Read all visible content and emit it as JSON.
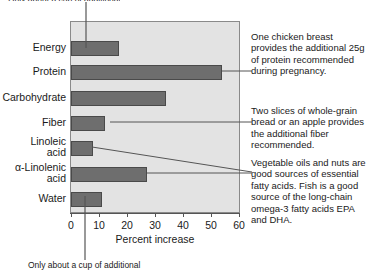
{
  "figure": {
    "top_caption": "Only about a cup of additional",
    "bottom_caption": "Only about a cup of additional"
  },
  "chart_data": {
    "type": "bar",
    "orientation": "horizontal",
    "title": "",
    "xlabel": "Percent increase",
    "ylabel": "",
    "xlim": [
      0,
      60
    ],
    "ticks": [
      "0",
      "10",
      "20",
      "30",
      "40",
      "50",
      "60"
    ],
    "tick_values": [
      0,
      10,
      20,
      30,
      40,
      50,
      60
    ],
    "grid": false,
    "legend": "none",
    "categories": [
      "Energy",
      "Protein",
      "Carbohydrate",
      "Fiber",
      "Linoleic\nacid",
      "α-Linolenic\nacid",
      "Water"
    ],
    "values": [
      17,
      54,
      34,
      12,
      8,
      27,
      11
    ],
    "bar_color": "#6e6e6e",
    "plot_background": "#e3e3e3"
  },
  "categories_display": [
    {
      "line1": "Energy",
      "line2": ""
    },
    {
      "line1": "Protein",
      "line2": ""
    },
    {
      "line1": "Carbohydrate",
      "line2": ""
    },
    {
      "line1": "Fiber",
      "line2": ""
    },
    {
      "line1": "Linoleic",
      "line2": "acid"
    },
    {
      "line1": "α-Linolenic",
      "line2": "acid"
    },
    {
      "line1": "Water",
      "line2": ""
    }
  ],
  "annotations": [
    {
      "id": "protein-note",
      "text": "One chicken breast provides the additional 25g of protein recommended during pregnancy."
    },
    {
      "id": "fiber-note",
      "text": "Two slices of whole-grain bread or an apple provides the additional fiber recommended."
    },
    {
      "id": "fat-note",
      "text": "Vegetable oils and nuts are good sources of essential fatty acids. Fish is a good source of the long-chain omega-3 fatty acids EPA and DHA."
    }
  ],
  "colors": {
    "bar": "#6e6e6e",
    "bar_border": "#4a4a4a",
    "plot_bg": "#e3e3e3",
    "plot_border": "#8a8a8a",
    "axis": "#555555",
    "text": "#1a1a1a",
    "page_bg": "#ffffff"
  }
}
